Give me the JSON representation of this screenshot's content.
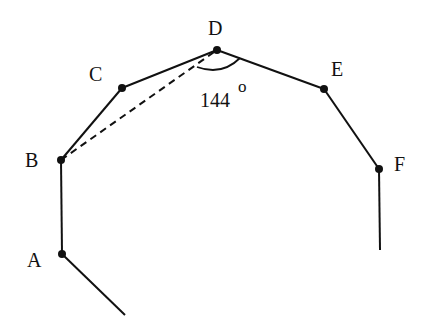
{
  "diagram": {
    "type": "polygon-partial",
    "vertices": [
      {
        "id": "A",
        "label": "A",
        "x": 62,
        "y": 254,
        "label_x": 27,
        "label_y": 267
      },
      {
        "id": "B",
        "label": "B",
        "x": 61,
        "y": 160,
        "label_x": 25,
        "label_y": 167
      },
      {
        "id": "C",
        "label": "C",
        "x": 122,
        "y": 88,
        "label_x": 89,
        "label_y": 81
      },
      {
        "id": "D",
        "label": "D",
        "x": 217,
        "y": 50,
        "label_x": 208,
        "label_y": 35
      },
      {
        "id": "E",
        "label": "E",
        "x": 324,
        "y": 89,
        "label_x": 331,
        "label_y": 76
      },
      {
        "id": "F",
        "label": "F",
        "x": 379,
        "y": 169,
        "label_x": 394,
        "label_y": 171
      }
    ],
    "edges": [
      {
        "from": "A",
        "to": "B",
        "style": "solid"
      },
      {
        "from": "B",
        "to": "C",
        "style": "solid"
      },
      {
        "from": "C",
        "to": "D",
        "style": "solid"
      },
      {
        "from": "D",
        "to": "E",
        "style": "solid"
      },
      {
        "from": "E",
        "to": "F",
        "style": "solid"
      },
      {
        "from": "B",
        "to": "D",
        "style": "dashed"
      }
    ],
    "extensions": [
      {
        "from": "A",
        "x2": 125,
        "y2": 315
      },
      {
        "from": "F",
        "x2": 380,
        "y2": 250
      }
    ],
    "angle": {
      "vertex": "D",
      "value": "144",
      "unit": "o",
      "label_x": 200,
      "label_y": 107
    },
    "colors": {
      "stroke": "#111111",
      "background": "#ffffff"
    }
  }
}
